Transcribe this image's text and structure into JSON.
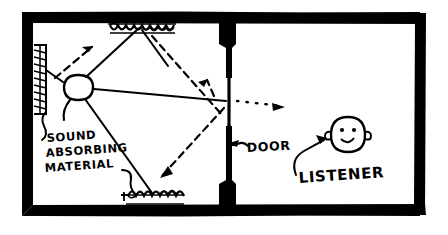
{
  "diagram": {
    "type": "hand-drawn acoustics sketch",
    "stroke_color": "#000000",
    "background_color": "#ffffff",
    "wall_color": "#000000"
  },
  "labels": {
    "absorber_line1": "SOUND",
    "absorber_line2": "ABSORBING",
    "absorber_line3": "MATERIAL",
    "door": "DOOR",
    "listener": "LISTENER"
  },
  "elements": {
    "source_name": "sound-source-oval",
    "door_name": "door-opening",
    "listener_name": "listener-head",
    "absorber_top_name": "absorbing-material-top",
    "absorber_left_name": "absorbing-material-left",
    "absorber_bottom_name": "absorbing-material-bottom"
  },
  "geometry": {
    "outer_wall": {
      "x": 22,
      "y": 12,
      "w": 404,
      "h": 204,
      "thickness": 11
    },
    "partition_x": 227,
    "door_gap": {
      "y_top": 78,
      "y_bottom": 176
    },
    "source": {
      "cx": 78,
      "cy": 88,
      "rx": 15,
      "ry": 12
    },
    "listener": {
      "cx": 348,
      "cy": 135,
      "r": 18
    }
  },
  "rays": {
    "solid_count": 5,
    "dashed_count": 3,
    "dotted_count": 1,
    "description": "Solid lines are incident rays from the source; dashed arrows are reflected rays; a dotted arrow passes through the door to the listener."
  }
}
